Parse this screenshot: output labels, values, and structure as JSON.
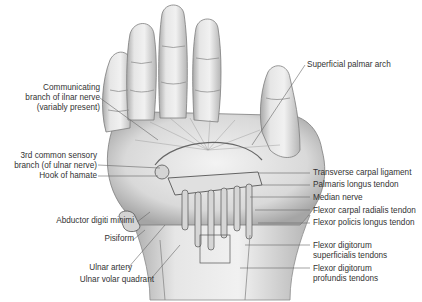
{
  "figure": {
    "colors": {
      "background": "#ffffff",
      "ink": "#333333",
      "skin": "#e9e9e9",
      "shadow": "#9a9a9a"
    }
  },
  "labels_left": [
    {
      "id": "communicating-branch",
      "lines": [
        "Communicating",
        "branch of ilnar nerve",
        "(variably present)"
      ]
    },
    {
      "id": "third-common-sensory",
      "lines": [
        "3rd common sensory",
        "branch (of ulnar nerve)"
      ]
    },
    {
      "id": "hook-of-hamate",
      "lines": [
        "Hook of hamate"
      ]
    },
    {
      "id": "abductor-digiti-minimi",
      "lines": [
        "Abductor digiti minimi"
      ]
    },
    {
      "id": "pisiform",
      "lines": [
        "Pisiform"
      ]
    },
    {
      "id": "ulnar-artery",
      "lines": [
        "Ulnar artery"
      ]
    },
    {
      "id": "ulnar-volar-quadrant",
      "lines": [
        "Ulnar volar quadrant"
      ]
    }
  ],
  "labels_right": [
    {
      "id": "superficial-palmar-arch",
      "lines": [
        "Superficial palmar arch"
      ]
    },
    {
      "id": "transverse-carpal-ligament",
      "lines": [
        "Transverse carpal ligament"
      ]
    },
    {
      "id": "palmaris-longus-tendon",
      "lines": [
        "Palmaris longus tendon"
      ]
    },
    {
      "id": "median-nerve",
      "lines": [
        "Median nerve"
      ]
    },
    {
      "id": "flexor-carpal-radialis-tendon",
      "lines": [
        "Flexor carpal radialis tendon"
      ]
    },
    {
      "id": "flexor-policis-longus-tendon",
      "lines": [
        "Flexor policis longus tendon"
      ]
    },
    {
      "id": "flexor-digitorum-superficialis",
      "lines": [
        "Flexor digitorum",
        "superficialis tendons"
      ]
    },
    {
      "id": "flexor-digitorum-profundis",
      "lines": [
        "Flexor digitorum",
        "profundis tendons"
      ]
    }
  ]
}
